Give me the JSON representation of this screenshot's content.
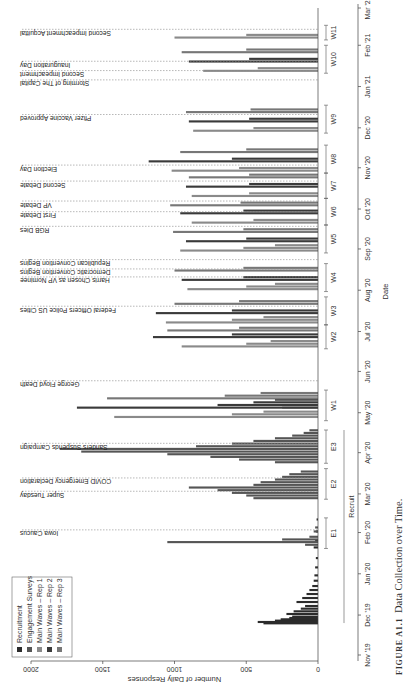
{
  "caption": {
    "label": "FIGURE A1.1",
    "title": "Data Collection over Time."
  },
  "chart_data": {
    "type": "bar",
    "title": "Data Collection over Time.",
    "xlabel": "Date",
    "ylabel": "Number of Daily Responses",
    "ylim": [
      0,
      2000
    ],
    "yticks": [
      0,
      500,
      1000,
      1500,
      2000
    ],
    "xticks": [
      "Nov '19",
      "Dec '19",
      "Jan '20",
      "Feb '20",
      "Mar '20",
      "Apr '20",
      "May '20",
      "Jun '20",
      "Jul '20",
      "Aug '20",
      "Sep '20",
      "Oct '20",
      "Nov '20",
      "Dec '20",
      "Jan '21",
      "Feb '21",
      "Mar '21"
    ],
    "legend": [
      {
        "name": "Recruitment",
        "color": "#2b2b2b"
      },
      {
        "name": "Engagement Surveys",
        "color": "#555555"
      },
      {
        "name": "Main Waves – Rep 1",
        "color": "#8a8a8a"
      },
      {
        "name": "Main Waves – Rep 2",
        "color": "#3a3a3a"
      },
      {
        "name": "Main Waves – Rep 3",
        "color": "#777777"
      }
    ],
    "events": [
      {
        "label": "Iowa Caucus",
        "date": "2020-02-03"
      },
      {
        "label": "Super Tuesday",
        "date": "2020-03-03"
      },
      {
        "label": "COVID Emergency Declaration",
        "date": "2020-03-13"
      },
      {
        "label": "Sanders Suspends Campaign",
        "date": "2020-04-08"
      },
      {
        "label": "George Floyd Death",
        "date": "2020-05-25"
      },
      {
        "label": "Federal Officers Police US Cities",
        "date": "2020-07-20"
      },
      {
        "label": "Harris Chosen as VP Nominee",
        "date": "2020-08-11"
      },
      {
        "label": "Democratic Convention Begins",
        "date": "2020-08-17"
      },
      {
        "label": "Republican Convention Begins",
        "date": "2020-08-24"
      },
      {
        "label": "RGB Dies",
        "date": "2020-09-18"
      },
      {
        "label": "First Debate",
        "date": "2020-09-29"
      },
      {
        "label": "VP Debate",
        "date": "2020-10-07"
      },
      {
        "label": "Second Debate",
        "date": "2020-10-22"
      },
      {
        "label": "Election Day",
        "date": "2020-11-03"
      },
      {
        "label": "Pfizer Vaccine Approved",
        "date": "2020-12-11"
      },
      {
        "label": "Storming of The Capital",
        "date": "2021-01-06"
      },
      {
        "label": "Second Impeachment",
        "date": "2021-01-13"
      },
      {
        "label": "Inauguration Day",
        "date": "2021-01-20"
      },
      {
        "label": "Second Impeachment Acquittal",
        "date": "2021-02-13"
      }
    ],
    "periods": [
      {
        "label": "E1",
        "start": "2020-01-20",
        "end": "2020-02-12"
      },
      {
        "label": "E2",
        "start": "2020-02-26",
        "end": "2020-03-20"
      },
      {
        "label": "E3",
        "start": "2020-03-24",
        "end": "2020-04-18"
      },
      {
        "label": "W1",
        "start": "2020-04-25",
        "end": "2020-05-18"
      },
      {
        "label": "W2",
        "start": "2020-06-18",
        "end": "2020-07-06"
      },
      {
        "label": "W3",
        "start": "2020-07-06",
        "end": "2020-07-27"
      },
      {
        "label": "W4",
        "start": "2020-07-31",
        "end": "2020-08-21"
      },
      {
        "label": "W5",
        "start": "2020-08-29",
        "end": "2020-09-19"
      },
      {
        "label": "W6",
        "start": "2020-09-19",
        "end": "2020-10-09"
      },
      {
        "label": "W7",
        "start": "2020-10-09",
        "end": "2020-10-28"
      },
      {
        "label": "W8",
        "start": "2020-10-28",
        "end": "2020-11-18"
      },
      {
        "label": "W9",
        "start": "2020-11-27",
        "end": "2020-12-18"
      },
      {
        "label": "W10",
        "start": "2021-01-11",
        "end": "2021-02-01"
      },
      {
        "label": "W11",
        "start": "2021-02-05",
        "end": "2021-02-16"
      }
    ],
    "recruit_period": {
      "label": "Recruit",
      "start": "2019-11-25",
      "end": "2020-04-18"
    },
    "series": [
      {
        "name": "Recruitment",
        "points": [
          [
            "2019-11-24",
            380
          ],
          [
            "2019-11-25",
            420
          ],
          [
            "2019-11-26",
            300
          ],
          [
            "2019-11-27",
            260
          ],
          [
            "2019-11-28",
            200
          ],
          [
            "2019-11-29",
            180
          ],
          [
            "2019-12-01",
            220
          ],
          [
            "2019-12-03",
            170
          ],
          [
            "2019-12-05",
            120
          ],
          [
            "2019-12-07",
            90
          ],
          [
            "2019-12-10",
            150
          ],
          [
            "2019-12-13",
            110
          ],
          [
            "2019-12-16",
            80
          ],
          [
            "2019-12-19",
            60
          ],
          [
            "2019-12-22",
            40
          ],
          [
            "2019-12-26",
            30
          ],
          [
            "2019-12-30",
            25
          ],
          [
            "2020-01-05",
            20
          ],
          [
            "2020-01-12",
            15
          ],
          [
            "2020-01-20",
            30
          ],
          [
            "2020-01-25",
            20
          ],
          [
            "2020-02-01",
            15
          ],
          [
            "2020-02-10",
            10
          ]
        ]
      },
      {
        "name": "Engagement Surveys",
        "points": [
          [
            "2020-01-22",
            90
          ],
          [
            "2020-01-24",
            1050
          ],
          [
            "2020-01-26",
            250
          ],
          [
            "2020-01-28",
            60
          ],
          [
            "2020-02-01",
            30
          ],
          [
            "2020-02-04",
            20
          ],
          [
            "2020-02-26",
            450
          ],
          [
            "2020-02-28",
            500
          ],
          [
            "2020-03-01",
            600
          ],
          [
            "2020-03-03",
            700
          ],
          [
            "2020-03-05",
            900
          ],
          [
            "2020-03-07",
            450
          ],
          [
            "2020-03-09",
            400
          ],
          [
            "2020-03-11",
            300
          ],
          [
            "2020-03-13",
            250
          ],
          [
            "2020-03-15",
            200
          ],
          [
            "2020-03-17",
            120
          ],
          [
            "2020-03-24",
            300
          ],
          [
            "2020-03-26",
            550
          ],
          [
            "2020-03-28",
            750
          ],
          [
            "2020-03-30",
            1050
          ],
          [
            "2020-04-01",
            1650
          ],
          [
            "2020-04-03",
            1800
          ],
          [
            "2020-04-05",
            850
          ],
          [
            "2020-04-07",
            600
          ],
          [
            "2020-04-09",
            450
          ],
          [
            "2020-04-11",
            300
          ],
          [
            "2020-04-13",
            180
          ],
          [
            "2020-04-15",
            100
          ],
          [
            "2020-04-17",
            60
          ]
        ]
      },
      {
        "name": "Main Waves – Rep 1",
        "points": [
          [
            "2020-04-27",
            1420
          ],
          [
            "2020-04-29",
            600
          ],
          [
            "2020-05-01",
            380
          ],
          [
            "2020-05-04",
            250
          ],
          [
            "2020-06-19",
            950
          ],
          [
            "2020-06-21",
            500
          ],
          [
            "2020-06-23",
            330
          ],
          [
            "2020-07-07",
            1060
          ],
          [
            "2020-07-09",
            600
          ],
          [
            "2020-07-11",
            380
          ],
          [
            "2020-08-01",
            910
          ],
          [
            "2020-08-03",
            500
          ],
          [
            "2020-08-05",
            300
          ],
          [
            "2020-08-30",
            960
          ],
          [
            "2020-09-01",
            520
          ],
          [
            "2020-09-03",
            300
          ],
          [
            "2020-09-20",
            880
          ],
          [
            "2020-09-22",
            450
          ],
          [
            "2020-10-10",
            880
          ],
          [
            "2020-10-12",
            480
          ],
          [
            "2020-10-29",
            1020
          ],
          [
            "2020-10-31",
            550
          ],
          [
            "2020-11-28",
            870
          ],
          [
            "2020-11-30",
            450
          ],
          [
            "2021-01-12",
            800
          ],
          [
            "2021-01-14",
            420
          ],
          [
            "2021-02-06",
            1000
          ],
          [
            "2021-02-08",
            500
          ]
        ]
      },
      {
        "name": "Main Waves – Rep 2",
        "points": [
          [
            "2020-05-04",
            1680
          ],
          [
            "2020-05-06",
            700
          ],
          [
            "2020-05-08",
            450
          ],
          [
            "2020-05-10",
            300
          ],
          [
            "2020-06-26",
            1150
          ],
          [
            "2020-06-28",
            600
          ],
          [
            "2020-07-14",
            1130
          ],
          [
            "2020-07-16",
            600
          ],
          [
            "2020-08-08",
            950
          ],
          [
            "2020-08-10",
            520
          ],
          [
            "2020-09-06",
            920
          ],
          [
            "2020-09-08",
            500
          ],
          [
            "2020-09-27",
            960
          ],
          [
            "2020-09-29",
            520
          ],
          [
            "2020-10-17",
            920
          ],
          [
            "2020-10-19",
            480
          ],
          [
            "2020-11-05",
            1180
          ],
          [
            "2020-11-07",
            600
          ],
          [
            "2020-12-05",
            900
          ],
          [
            "2020-12-07",
            480
          ],
          [
            "2021-01-19",
            900
          ],
          [
            "2021-01-21",
            480
          ]
        ]
      },
      {
        "name": "Main Waves – Rep 3",
        "points": [
          [
            "2020-05-11",
            1470
          ],
          [
            "2020-05-13",
            650
          ],
          [
            "2020-05-15",
            400
          ],
          [
            "2020-07-01",
            1050
          ],
          [
            "2020-07-03",
            550
          ],
          [
            "2020-07-21",
            1000
          ],
          [
            "2020-07-23",
            550
          ],
          [
            "2020-08-15",
            1000
          ],
          [
            "2020-08-17",
            520
          ],
          [
            "2020-09-13",
            1010
          ],
          [
            "2020-09-15",
            520
          ],
          [
            "2020-10-03",
            1030
          ],
          [
            "2020-10-05",
            540
          ],
          [
            "2020-10-24",
            900
          ],
          [
            "2020-10-26",
            480
          ],
          [
            "2020-11-12",
            960
          ],
          [
            "2020-11-14",
            500
          ],
          [
            "2020-12-12",
            920
          ],
          [
            "2020-12-14",
            470
          ],
          [
            "2021-01-26",
            950
          ],
          [
            "2021-01-28",
            500
          ]
        ]
      }
    ]
  }
}
